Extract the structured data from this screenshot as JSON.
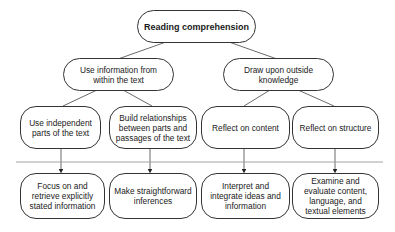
{
  "diagram": {
    "root": {
      "label": "Reading comprehension"
    },
    "level2": [
      {
        "label": "Use information from\nwithin the text"
      },
      {
        "label": "Draw upon outside\nknowledge"
      }
    ],
    "level3": [
      {
        "label": "Use independent\nparts of the text"
      },
      {
        "label": "Build relationships\nbetween parts and\npassages of the text"
      },
      {
        "label": "Reflect on content"
      },
      {
        "label": "Reflect on structure"
      }
    ],
    "level4": [
      {
        "label": "Focus on and\nretrieve explicitly\nstated information"
      },
      {
        "label": "Make straightforward\ninferences"
      },
      {
        "label": "Interpret and\nintegrate ideas and\ninformation"
      },
      {
        "label": "Examine and\nevaluate content,\nlanguage, and\ntextual elements"
      }
    ],
    "colors": {
      "stroke": "#333333",
      "divider": "#999999",
      "background": "#ffffff"
    }
  }
}
